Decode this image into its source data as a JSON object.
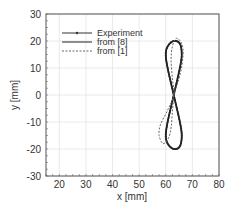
{
  "chart_data": {
    "type": "line",
    "title": "",
    "xlabel": "x [mm]",
    "ylabel": "y [mm]",
    "xlim": [
      15,
      80
    ],
    "ylim": [
      -30,
      30
    ],
    "xticks": [
      20,
      30,
      40,
      50,
      60,
      70,
      80
    ],
    "yticks": [
      -30,
      -20,
      -10,
      0,
      10,
      20,
      30
    ],
    "grid": true,
    "legend_position": "upper left",
    "series": [
      {
        "name": "Experiment",
        "style": "solid with dot markers",
        "color": "#333333",
        "x": [
          63,
          65.3,
          66,
          65.3,
          63,
          60.7,
          60,
          60.7,
          63,
          65.3,
          66,
          65.3,
          63,
          60.7,
          60,
          60.7,
          63
        ],
        "y": [
          0,
          10,
          15,
          19,
          20,
          18,
          15,
          10,
          0,
          -10,
          -15,
          -19,
          -20,
          -18,
          -15,
          -10,
          0
        ]
      },
      {
        "name": "from [8]",
        "style": "solid",
        "color": "#222222",
        "x": [
          63,
          65.3,
          66,
          65.3,
          63,
          60.7,
          60,
          60.7,
          63,
          65.3,
          66,
          65.3,
          63,
          60.7,
          60,
          60.7,
          63
        ],
        "y": [
          0,
          10,
          15,
          19,
          20,
          18,
          15,
          10,
          0,
          -10,
          -15,
          -19,
          -20,
          -18,
          -15,
          -10,
          0
        ]
      },
      {
        "name": "from [1]",
        "style": "dashed",
        "color": "#666666",
        "x": [
          63,
          65.5,
          66.5,
          66,
          64,
          62.5,
          62,
          62.5,
          63,
          60.5,
          58,
          57.5,
          59,
          61,
          62,
          62.5,
          63
        ],
        "y": [
          0,
          8,
          15,
          19,
          21,
          18,
          13,
          6,
          0,
          -6,
          -11,
          -15,
          -18,
          -16,
          -12,
          -6,
          0
        ]
      }
    ]
  }
}
